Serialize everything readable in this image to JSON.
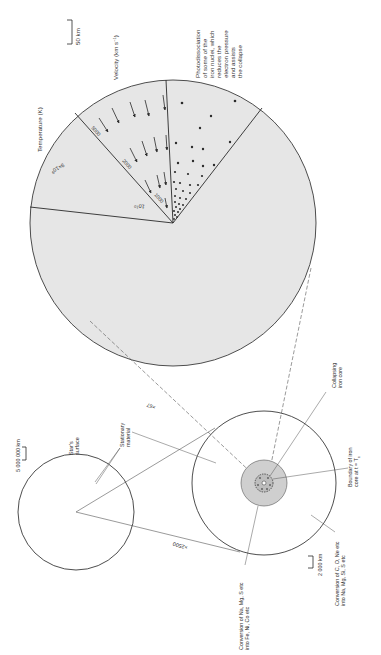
{
  "figure": {
    "orientation": "rotated 90 degrees (text reads bottom-to-top)",
    "colors": {
      "line": "#3a3a3a",
      "fill_core": "#e6e6e6",
      "fill_shell": "#cfcfcf",
      "background": "#ffffff"
    }
  },
  "star_view": {
    "scale_bar": "5 000 000 km",
    "surface_label": [
      "Star's",
      "surface"
    ],
    "magnification": "×2500"
  },
  "shell_view": {
    "stationary_label": [
      "Stationary",
      "material"
    ],
    "scale_bar": "2 000 km",
    "conversion_outer": [
      "Conversion of C, O, Ne etc",
      "into Na, Mg, Si, S etc"
    ],
    "conversion_inner": [
      "Conversion of Na, Mg, S etc",
      "into Fe, Ni, Co etc"
    ],
    "boundary_label": [
      "Boundary of iron",
      "core at t = T",
      "c"
    ],
    "collapsing_label": [
      "Collapsing",
      "iron core"
    ],
    "magnification": "×67"
  },
  "core_view": {
    "scale_bar": "50 km",
    "temperature_title": "Temperature (K)",
    "velocity_title": "Velocity (km s",
    "velocity_unit_sup": "−1",
    "velocity_close": ")",
    "temperature_values": [
      "9×10",
      "10"
    ],
    "temperature_exponents": [
      "9",
      "10"
    ],
    "velocity_contours": [
      "5000",
      "2000",
      "1000"
    ],
    "photodissociation_label": [
      "Photodissociation",
      "of some of the",
      "iron nuclei, which",
      "reduces the",
      "electron pressure",
      "and assists",
      "the collapse"
    ]
  }
}
